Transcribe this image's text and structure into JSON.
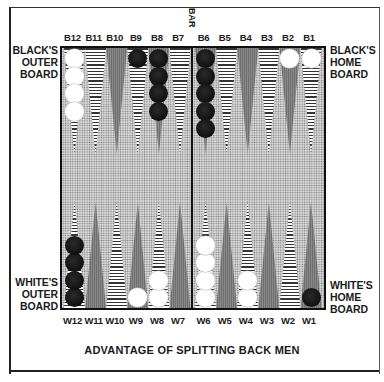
{
  "diagram": {
    "title": "ADVANTAGE OF SPLITTING BACK MEN",
    "bar_label": "BAR",
    "side_labels": {
      "black_outer": [
        "BLACK'S",
        "OUTER",
        "BOARD"
      ],
      "black_home": [
        "BLACK'S",
        "HOME",
        "BOARD"
      ],
      "white_outer": [
        "WHITE'S",
        "OUTER",
        "BOARD"
      ],
      "white_home": [
        "WHITE'S",
        "HOME",
        "BOARD"
      ]
    },
    "colors": {
      "board_background": "#d8d8d8",
      "black_checker": "#0a0a0a",
      "white_checker": "#ffffff",
      "border": "#111111"
    },
    "top_points": [
      {
        "label": "B12",
        "style": "striped",
        "checkers": {
          "color": "white",
          "count": 4
        }
      },
      {
        "label": "B11",
        "style": "striped",
        "checkers": null
      },
      {
        "label": "B10",
        "style": "solid",
        "checkers": null
      },
      {
        "label": "B9",
        "style": "striped",
        "checkers": {
          "color": "black",
          "count": 1
        }
      },
      {
        "label": "B8",
        "style": "solid",
        "checkers": {
          "color": "black",
          "count": 4
        }
      },
      {
        "label": "B7",
        "style": "striped",
        "checkers": null
      },
      {
        "label": "B6",
        "style": "solid",
        "checkers": {
          "color": "black",
          "count": 5
        }
      },
      {
        "label": "B5",
        "style": "striped",
        "checkers": null
      },
      {
        "label": "B4",
        "style": "solid",
        "checkers": null
      },
      {
        "label": "B3",
        "style": "striped",
        "checkers": null
      },
      {
        "label": "B2",
        "style": "solid",
        "checkers": {
          "color": "white",
          "count": 1
        }
      },
      {
        "label": "B1",
        "style": "striped",
        "checkers": {
          "color": "white",
          "count": 1
        }
      }
    ],
    "bottom_points": [
      {
        "label": "W12",
        "style": "striped",
        "checkers": {
          "color": "black",
          "count": 4
        }
      },
      {
        "label": "W11",
        "style": "solid",
        "checkers": null
      },
      {
        "label": "W10",
        "style": "striped",
        "checkers": null
      },
      {
        "label": "W9",
        "style": "solid",
        "checkers": {
          "color": "white",
          "count": 1
        }
      },
      {
        "label": "W8",
        "style": "striped",
        "checkers": {
          "color": "white",
          "count": 2
        }
      },
      {
        "label": "W7",
        "style": "solid",
        "checkers": null
      },
      {
        "label": "W6",
        "style": "striped",
        "checkers": {
          "color": "white",
          "count": 4
        }
      },
      {
        "label": "W5",
        "style": "solid",
        "checkers": null
      },
      {
        "label": "W4",
        "style": "striped",
        "checkers": {
          "color": "white",
          "count": 2
        }
      },
      {
        "label": "W3",
        "style": "solid",
        "checkers": null
      },
      {
        "label": "W2",
        "style": "striped",
        "checkers": null
      },
      {
        "label": "W1",
        "style": "solid",
        "checkers": {
          "color": "black",
          "count": 1
        }
      }
    ]
  }
}
